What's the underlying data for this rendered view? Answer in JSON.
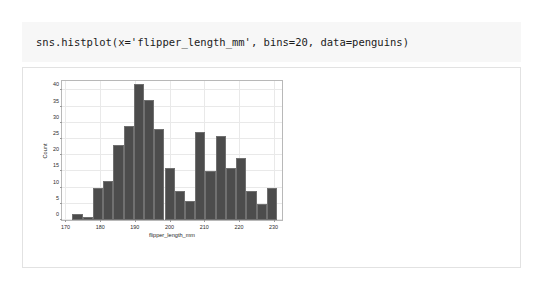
{
  "notebook": {
    "code": "sns.histplot(x='flipper_length_mm', bins=20, data=penguins)"
  },
  "chart_data": {
    "type": "bar",
    "title": "",
    "subtitle": "",
    "xlabel": "flipper_length_mm",
    "ylabel": "Count",
    "grid": true,
    "legend": null,
    "bar_color": "#4c4c4c",
    "bar_edge_color": "#707070",
    "bins": 20,
    "bin_width": 2.95,
    "bin_edges": [
      172.0,
      174.95,
      177.9,
      180.85,
      183.8,
      186.75,
      189.7,
      192.65,
      195.6,
      198.55,
      201.5,
      204.45,
      207.4,
      210.35,
      213.3,
      216.25,
      219.2,
      222.15,
      225.1,
      228.05,
      231.0
    ],
    "bin_centers": [
      173.5,
      176.4,
      179.4,
      182.3,
      185.3,
      188.2,
      191.2,
      194.1,
      197.1,
      200.0,
      203.0,
      205.9,
      208.9,
      211.8,
      214.8,
      217.7,
      220.7,
      223.6,
      226.6,
      229.5
    ],
    "values": [
      2,
      1,
      10,
      12,
      23,
      29,
      42,
      37,
      28,
      16,
      9,
      6,
      27,
      15,
      26,
      16,
      19,
      9,
      5,
      10
    ],
    "xlim": [
      169.0,
      233.0
    ],
    "ylim": [
      0,
      43.5
    ],
    "xticks": [
      170,
      180,
      190,
      200,
      210,
      220,
      230
    ],
    "xticklabels": [
      "170",
      "180",
      "190",
      "200",
      "210",
      "220",
      "230"
    ],
    "yticks": [
      0,
      5,
      10,
      15,
      20,
      25,
      30,
      35,
      40
    ],
    "yticklabels": [
      "0",
      "5",
      "10",
      "15",
      "20",
      "25",
      "30",
      "35",
      "40"
    ]
  }
}
